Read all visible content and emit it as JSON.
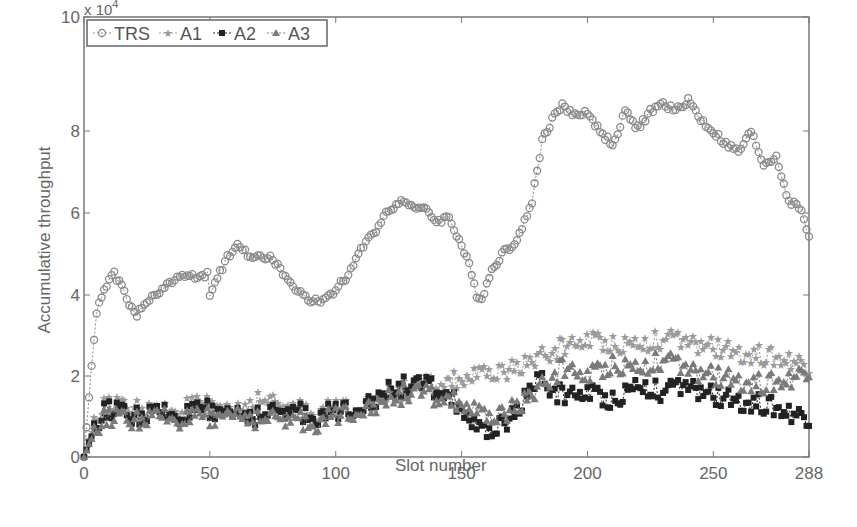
{
  "chart_data": {
    "type": "line",
    "title": "",
    "xlabel": "Slot number",
    "ylabel": "Accumulative throughput",
    "y_multiplier": "x 10^4",
    "xlim": [
      0,
      288
    ],
    "ylim": [
      0,
      10
    ],
    "xticks": [
      "0",
      "50",
      "100",
      "150",
      "200",
      "250",
      "288"
    ],
    "yticks": [
      "0",
      "2",
      "4",
      "6",
      "8",
      "10"
    ],
    "grid": false,
    "legend_position": "top-left",
    "legend": [
      "TRS",
      "A1",
      "A2",
      "A3"
    ],
    "series": [
      {
        "name": "TRS",
        "marker": "circle",
        "color": "#8a8a8a",
        "x": [
          0,
          3,
          5,
          7,
          10,
          12,
          15,
          18,
          21,
          25,
          30,
          35,
          40,
          45,
          49,
          50,
          53,
          57,
          61,
          65,
          70,
          75,
          80,
          85,
          90,
          95,
          100,
          105,
          110,
          115,
          120,
          125,
          130,
          135,
          140,
          145,
          150,
          153,
          156,
          158,
          162,
          166,
          170,
          174,
          178,
          182,
          186,
          190,
          195,
          200,
          205,
          210,
          215,
          220,
          225,
          230,
          235,
          240,
          245,
          250,
          255,
          260,
          265,
          270,
          275,
          280,
          285,
          288
        ],
        "y": [
          0,
          2.2,
          3.5,
          4.0,
          4.4,
          4.5,
          4.2,
          3.8,
          3.5,
          3.8,
          4.1,
          4.3,
          4.5,
          4.4,
          4.5,
          3.9,
          4.4,
          4.9,
          5.3,
          5.0,
          4.9,
          4.9,
          4.4,
          4.1,
          3.8,
          3.9,
          4.1,
          4.5,
          5.1,
          5.5,
          6.0,
          6.3,
          6.2,
          6.1,
          5.8,
          5.9,
          5.2,
          4.7,
          4.0,
          3.9,
          4.6,
          5.0,
          5.2,
          5.6,
          6.3,
          7.8,
          8.3,
          8.7,
          8.4,
          8.5,
          8.0,
          7.7,
          8.5,
          8.1,
          8.5,
          8.7,
          8.5,
          8.8,
          8.3,
          8.0,
          7.7,
          7.5,
          8.0,
          7.2,
          7.4,
          6.3,
          6.1,
          5.4
        ]
      },
      {
        "name": "A1",
        "marker": "star",
        "color": "#9a9a9a",
        "x": [
          0,
          5,
          10,
          20,
          30,
          40,
          50,
          60,
          70,
          80,
          90,
          100,
          110,
          120,
          130,
          140,
          150,
          160,
          170,
          180,
          190,
          200,
          210,
          220,
          230,
          240,
          250,
          260,
          270,
          280,
          288
        ],
        "y": [
          0,
          1.1,
          1.3,
          1.2,
          1.1,
          1.2,
          1.3,
          1.2,
          1.4,
          1.3,
          1.1,
          1.2,
          1.3,
          1.5,
          1.7,
          1.8,
          1.9,
          2.0,
          2.2,
          2.4,
          2.7,
          2.9,
          2.8,
          2.8,
          2.9,
          2.8,
          2.7,
          2.6,
          2.5,
          2.4,
          2.3
        ]
      },
      {
        "name": "A2",
        "marker": "square",
        "color": "#222222",
        "x": [
          0,
          5,
          10,
          20,
          30,
          40,
          50,
          60,
          70,
          80,
          90,
          100,
          110,
          120,
          130,
          140,
          150,
          155,
          160,
          165,
          170,
          180,
          190,
          200,
          210,
          220,
          230,
          240,
          250,
          260,
          270,
          280,
          288
        ],
        "y": [
          0,
          0.9,
          1.2,
          1.0,
          1.1,
          1.0,
          1.2,
          1.1,
          1.0,
          1.2,
          1.0,
          1.1,
          1.3,
          1.6,
          1.8,
          1.7,
          1.2,
          0.7,
          0.5,
          0.8,
          1.0,
          1.9,
          1.5,
          1.6,
          1.4,
          1.8,
          1.6,
          1.7,
          1.5,
          1.4,
          1.3,
          1.1,
          1.0
        ]
      },
      {
        "name": "A3",
        "marker": "triangle",
        "color": "#7a7a7a",
        "x": [
          0,
          5,
          10,
          20,
          30,
          40,
          50,
          60,
          70,
          80,
          90,
          100,
          110,
          120,
          130,
          140,
          150,
          160,
          170,
          180,
          190,
          200,
          210,
          220,
          230,
          240,
          250,
          260,
          270,
          280,
          288
        ],
        "y": [
          0,
          0.8,
          1.0,
          0.9,
          1.0,
          0.9,
          1.0,
          1.1,
          0.9,
          1.0,
          0.8,
          1.0,
          1.2,
          1.4,
          1.6,
          1.5,
          1.3,
          0.9,
          1.2,
          1.6,
          2.2,
          2.0,
          2.3,
          2.2,
          2.4,
          2.1,
          2.0,
          1.9,
          1.8,
          1.9,
          2.2
        ]
      }
    ]
  }
}
